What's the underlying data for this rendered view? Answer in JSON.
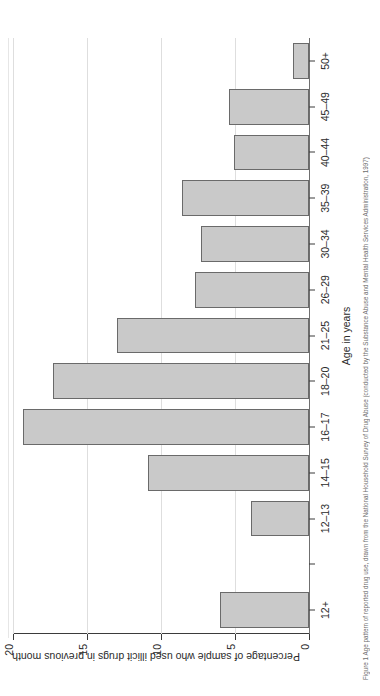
{
  "chart_data": {
    "type": "bar",
    "title": "",
    "xlabel": "Age in years",
    "ylabel": "Percentage of sample who used illicit drugs in previous month",
    "categories": [
      "12+",
      "",
      "12–13",
      "14–15",
      "16–17",
      "18–20",
      "21–25",
      "26–29",
      "30–34",
      "35–39",
      "40–44",
      "45–49",
      "50+"
    ],
    "values": [
      6.0,
      null,
      3.9,
      10.9,
      19.3,
      17.3,
      13.0,
      7.7,
      7.3,
      8.6,
      5.1,
      5.4,
      1.1
    ],
    "ylim": [
      0,
      20
    ],
    "yticks": [
      0,
      5,
      10,
      15,
      20
    ],
    "ytick_labels": [
      "0",
      "5",
      "10",
      "15",
      "20"
    ],
    "grid": "horizontal",
    "legend": "none",
    "bar_color": "#c9c9c9",
    "bar_edge_color": "#6a6a6a",
    "orientation": "vertical-on-rotated-page"
  },
  "figure": {
    "caption": "Figure 1  Age pattern of reported drug use, drawn from the National Household Survey of Drug Abuse (conducted by the Substance Abuse and Mental Health Services Administration, 1997)",
    "page_rotation": "90° counter-clockwise"
  }
}
